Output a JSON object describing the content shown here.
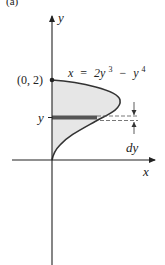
{
  "figure": {
    "panel_label": "(a)",
    "axes": {
      "x_label": "x",
      "y_label": "y"
    },
    "point_label": "(0, 2)",
    "curve_equation": {
      "lhs": "x",
      "eq": "=",
      "term1_coef": "2y",
      "term1_exp": "3",
      "minus": "−",
      "term2_base": "y",
      "term2_exp": "4"
    },
    "strip_label": "y",
    "increment_label": "dy",
    "colors": {
      "region_fill": "#e6e6e6",
      "strip_fill": "#555555",
      "curve": "#333333",
      "axes": "#222222"
    }
  }
}
